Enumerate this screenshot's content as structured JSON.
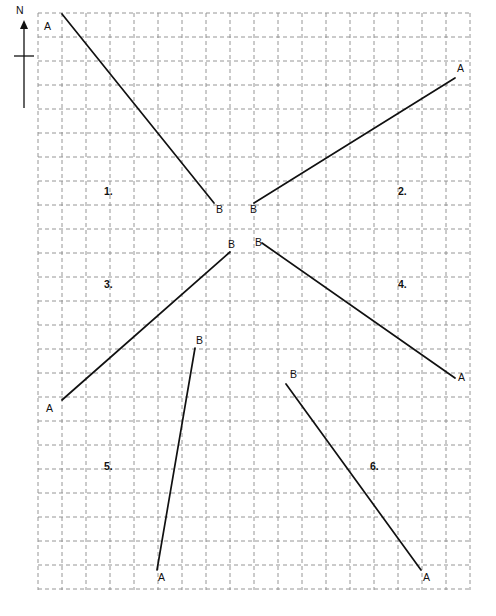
{
  "page": {
    "background_color": "#ffffff",
    "width": 496,
    "height": 616
  },
  "compass": {
    "name": "north-indicator",
    "label": "N",
    "label_x": 16,
    "label_y": 14,
    "shaft_x": 24,
    "shaft_top": 22,
    "shaft_bottom": 108,
    "arrow_tip_y": 20,
    "tick_y": 56,
    "tick_x1": 14,
    "tick_x2": 34,
    "color": "#111111"
  },
  "grid": {
    "x": 38,
    "y": 13,
    "width": 432,
    "height": 577,
    "cell_size": 24,
    "columns": 18,
    "rows": 24,
    "line_color": "#8a8a8a",
    "dash": "4 3"
  },
  "chart_data": {
    "type": "diagram",
    "grid_cell_size": 24,
    "items": [
      {
        "number": "1.",
        "number_x": 104,
        "number_y": 195,
        "a": {
          "x": 62,
          "y": 14,
          "label": "A",
          "label_x": 44,
          "label_y": 30
        },
        "b": {
          "x": 214,
          "y": 203,
          "label": "B",
          "label_x": 216,
          "label_y": 213
        },
        "direction": "southeast"
      },
      {
        "number": "2.",
        "number_x": 398,
        "number_y": 195,
        "a": {
          "x": 455,
          "y": 78,
          "label": "A",
          "label_x": 457,
          "label_y": 72
        },
        "b": {
          "x": 254,
          "y": 203,
          "label": "B",
          "label_x": 250,
          "label_y": 213
        },
        "direction": "northeast"
      },
      {
        "number": "3.",
        "number_x": 104,
        "number_y": 288,
        "a": {
          "x": 62,
          "y": 400,
          "label": "A",
          "label_x": 46,
          "label_y": 412
        },
        "b": {
          "x": 230,
          "y": 252,
          "label": "B",
          "label_x": 228,
          "label_y": 248
        },
        "direction": "northeast"
      },
      {
        "number": "4.",
        "number_x": 398,
        "number_y": 288,
        "a": {
          "x": 455,
          "y": 378,
          "label": "A",
          "label_x": 458,
          "label_y": 381
        },
        "b": {
          "x": 262,
          "y": 243,
          "label": "B",
          "label_x": 255,
          "label_y": 246
        },
        "direction": "southeast"
      },
      {
        "number": "5.",
        "number_x": 104,
        "number_y": 470,
        "a": {
          "x": 157,
          "y": 570,
          "label": "A",
          "label_x": 158,
          "label_y": 581
        },
        "b": {
          "x": 195,
          "y": 348,
          "label": "B",
          "label_x": 196,
          "label_y": 344
        },
        "direction": "north-northeast"
      },
      {
        "number": "6.",
        "number_x": 370,
        "number_y": 470,
        "a": {
          "x": 421,
          "y": 570,
          "label": "A",
          "label_x": 423,
          "label_y": 581
        },
        "b": {
          "x": 286,
          "y": 384,
          "label": "B",
          "label_x": 290,
          "label_y": 378
        },
        "direction": "southeast"
      }
    ]
  }
}
